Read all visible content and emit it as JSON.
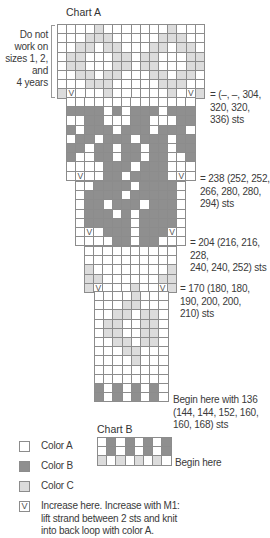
{
  "chart_a": {
    "title": "Chart A",
    "side_note": [
      "Do not",
      "work on",
      "sizes 1, 2,",
      "and",
      "4 years"
    ],
    "annotations": [
      {
        "lines": [
          "= (–, –, 304,",
          "320, 320,",
          "336) sts"
        ]
      },
      {
        "lines": [
          "= 238 (252, 252,",
          "266, 280, 280,",
          "294) sts"
        ]
      },
      {
        "lines": [
          "= 204 (216, 216, 228,",
          "240, 240, 252) sts"
        ]
      },
      {
        "lines": [
          "= 170 (180, 180,",
          "190, 200, 200,",
          "210) sts"
        ]
      },
      {
        "lines": [
          "Begin here with 136",
          "(144, 144, 152, 160,",
          "160, 168) sts"
        ]
      }
    ],
    "sections": [
      {
        "cols": 16,
        "x": 57,
        "y": 24,
        "rows": [
          "AAAACAAAAAAACAAA",
          "AAACCCAAAAACCCAA",
          "AACCACCAAACCACCA",
          "ACCAAACCACCAAACC",
          "ACCAAACCACCAAACC",
          "AACCACCAAACCACCA",
          "AAACCCAAAAACCCAA",
          "CVAAACAAAAAACAVC"
        ]
      },
      {
        "cols": 14,
        "x": 66,
        "y": 97,
        "rows": [
          "AAAAAAAAAAAAAA",
          "BBBBABABBBABBB",
          "AABBAAABBAAABB",
          "BABBBABBBABBBA",
          "ABBABBBABBBABB",
          "BBABBABBABBABB",
          "BAABBABBABBAAB",
          "AAAABBBABBBAAA",
          "AVAABBABBBBAVA"
        ]
      },
      {
        "cols": 12,
        "x": 75,
        "y": 181,
        "rows": [
          "AABBBBABBBBA",
          "ABBBBABBBBBA",
          "ABBABBBABBBA",
          "ABBBABABBBBA",
          "ABBBBBABBBBA",
          "AVABBBABBBVA",
          "AAAABBABBAAA"
        ]
      },
      {
        "cols": 10,
        "x": 84,
        "y": 246,
        "rows": [
          "AAAAAAAAAA",
          "AAAAAAAAAA",
          "CAAAAAAAAC",
          "CCAAAAAACC",
          "CVAAACAAVC"
        ]
      },
      {
        "cols": 8,
        "x": 94,
        "y": 291,
        "rows": [
          "AAAACAAA",
          "AAACCAAA",
          "AACCACCA",
          "ACCAACCA",
          "ACCAACCA",
          "AACCACCA",
          "AAACCAAA",
          "AAAACAAA",
          "AAAAAAAA",
          "AAAAAAAA",
          "BABABABA",
          "BABABABA"
        ]
      }
    ]
  },
  "chart_b": {
    "title": "Chart B",
    "begin_label": "Begin here",
    "rows": [
      "ABABABAB",
      "ABABABAB",
      "CACACACA"
    ]
  },
  "legend": {
    "items": [
      {
        "key": "A",
        "label": "Color A",
        "color": "#ffffff"
      },
      {
        "key": "B",
        "label": "Color B",
        "color": "#8f8f8f"
      },
      {
        "key": "C",
        "label": "Color C",
        "color": "#dcdcdc"
      }
    ],
    "increase_symbol": "V",
    "increase_text": [
      "Increase here. Increase with M1:",
      "lift strand between 2 sts and knit",
      "into back loop with color A."
    ]
  }
}
